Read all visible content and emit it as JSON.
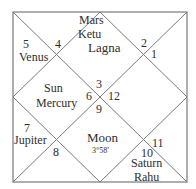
{
  "chart": {
    "line_color": "#7a7a7a",
    "text_color": "#2e2e2e",
    "houses": [
      {
        "position": "top-diamond",
        "house_number": "4",
        "planets": [
          "Mars",
          "Ketu"
        ]
      },
      {
        "position": "top-left-triangle",
        "house_number": "5",
        "planets": [
          "Venus"
        ]
      },
      {
        "position": "center-top-diamond",
        "house_number": "3",
        "label": "Lagna",
        "planets": []
      },
      {
        "position": "top-right-triangle",
        "house_number": "2",
        "planets": []
      },
      {
        "position": "right-triangle",
        "house_number": "1",
        "planets": []
      },
      {
        "position": "left-diamond",
        "house_number": "6",
        "planets": [
          "Sun",
          "Mercury"
        ]
      },
      {
        "position": "right-diamond",
        "house_number": "12",
        "planets": []
      },
      {
        "position": "bottom-left-triangle",
        "house_number": "7",
        "planets": [
          "Jupiter"
        ]
      },
      {
        "position": "bottom-left-lower-triangle",
        "house_number": "8",
        "planets": []
      },
      {
        "position": "bottom-diamond",
        "house_number": "9",
        "planets": [
          "Moon"
        ],
        "note": "3°58'"
      },
      {
        "position": "bottom-right-lower-triangle",
        "house_number": "10",
        "planets": [
          "Saturn",
          "Rahu"
        ]
      },
      {
        "position": "bottom-right-triangle",
        "house_number": "11",
        "planets": []
      }
    ]
  },
  "labels": {
    "mars": "Mars",
    "ketu": "Ketu",
    "n4": "4",
    "n5": "5",
    "venus": "Venus",
    "lagna": "Lagna",
    "n2": "2",
    "n1": "1",
    "sun": "Sun",
    "mercury": "Mercury",
    "n3": "3",
    "n6": "6",
    "n12": "12",
    "n9": "9",
    "n7": "7",
    "jupiter": "Jupiter",
    "n8": "8",
    "moon": "Moon",
    "moon_degree": "3°58'",
    "n11": "11",
    "n10": "10",
    "saturn": "Saturn",
    "rahu": "Rahu"
  }
}
